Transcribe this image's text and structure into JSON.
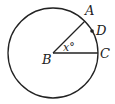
{
  "diagram": {
    "type": "circle-geometry",
    "center": {
      "label": "B"
    },
    "points": [
      {
        "label": "A"
      },
      {
        "label": "D"
      },
      {
        "label": "C"
      }
    ],
    "angle": {
      "label": "x°",
      "vertex": "B",
      "between": [
        "A",
        "C"
      ]
    },
    "colors": {
      "stroke": "#222222",
      "background": "#ffffff"
    }
  }
}
